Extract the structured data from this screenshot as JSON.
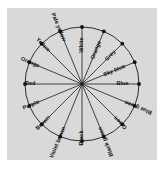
{
  "figure": {
    "panel_color": "#d9d9d9",
    "background_color": "#ffffff",
    "line_color": "#1a1a1a",
    "label_color": "#111111"
  },
  "chart_data": {
    "type": "pie",
    "title": "",
    "subtitle": "",
    "xlabel": "",
    "ylabel": "",
    "legend_position": "none",
    "grid": false,
    "slice_count": 16,
    "slice_angle_degrees": 22.5,
    "values": [
      1,
      1,
      1,
      1,
      1,
      1,
      1,
      1,
      1,
      1,
      1,
      1,
      1,
      1,
      1,
      1
    ],
    "categories": [
      "White",
      "Orange",
      "Grey",
      "Sky blue",
      "Blue",
      "Blue green",
      "Green",
      "Black green",
      "Black",
      "Violet brown",
      "Brown",
      "Purple",
      "Red",
      "Orange",
      "Yellow",
      "Pale yellow"
    ],
    "annotations": [
      {
        "label": "White",
        "angle_degrees": 90
      },
      {
        "label": "Orange",
        "angle_degrees": 67.5
      },
      {
        "label": "Grey",
        "angle_degrees": 45
      },
      {
        "label": "Sky blue",
        "angle_degrees": 22.5
      },
      {
        "label": "Blue",
        "angle_degrees": 0
      },
      {
        "label": "Blue green",
        "angle_degrees": 337.5
      },
      {
        "label": "Green",
        "angle_degrees": 315
      },
      {
        "label": "Black green",
        "angle_degrees": 292.5
      },
      {
        "label": "Black",
        "angle_degrees": 270
      },
      {
        "label": "Violet brown",
        "angle_degrees": 247.5
      },
      {
        "label": "Brown",
        "angle_degrees": 225
      },
      {
        "label": "Purple",
        "angle_degrees": 202.5
      },
      {
        "label": "Red",
        "angle_degrees": 180
      },
      {
        "label": "Orange",
        "angle_degrees": 157.5
      },
      {
        "label": "Yellow",
        "angle_degrees": 135
      },
      {
        "label": "Pale yellow",
        "angle_degrees": 112.5
      }
    ]
  }
}
